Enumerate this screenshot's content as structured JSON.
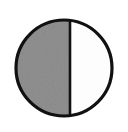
{
  "figure": {
    "name": "half-shaded-circle",
    "canvas": {
      "width": 128,
      "height": 132,
      "background_color": "#ffffff"
    },
    "circle": {
      "center_x": 64,
      "center_y": 68,
      "radius": 48,
      "outline_color": "#111111",
      "outline_width": 3.2
    },
    "divider": {
      "name": "vertical-diameter-line",
      "x": 70,
      "y_top": 20,
      "y_bottom": 116,
      "color": "#111111",
      "width": 2.6
    },
    "halves": [
      {
        "name": "left-half",
        "position": "left",
        "fill_color": "#8a8a8a",
        "state": "shaded",
        "fraction": "1/2"
      },
      {
        "name": "right-half",
        "position": "right",
        "fill_color": "#fdfdfd",
        "state": "unshaded",
        "fraction": "1/2"
      }
    ]
  },
  "chart_data": {
    "type": "pie",
    "title": "",
    "categories": [
      "shaded",
      "unshaded"
    ],
    "values": [
      50,
      50
    ],
    "colors": [
      "#8a8a8a",
      "#ffffff"
    ],
    "legend": "none",
    "labels": []
  }
}
